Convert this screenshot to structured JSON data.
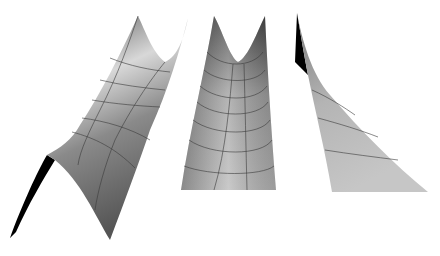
{
  "figure": {
    "panels": [
      {
        "id": "left",
        "shape": "ridge-saddle surface",
        "colors": {
          "light": "#d9d9d9",
          "dark": "#5a5a5a",
          "underside": "#000000"
        }
      },
      {
        "id": "middle",
        "shape": "valley (U-shaped) surface",
        "colors": {
          "light": "#c8c8c8",
          "dark": "#4a4a4a"
        }
      },
      {
        "id": "right",
        "shape": "curved triangular sheet",
        "colors": {
          "light": "#c4c4c4",
          "dark": "#6a6a6a",
          "underside": "#000000"
        }
      }
    ]
  }
}
